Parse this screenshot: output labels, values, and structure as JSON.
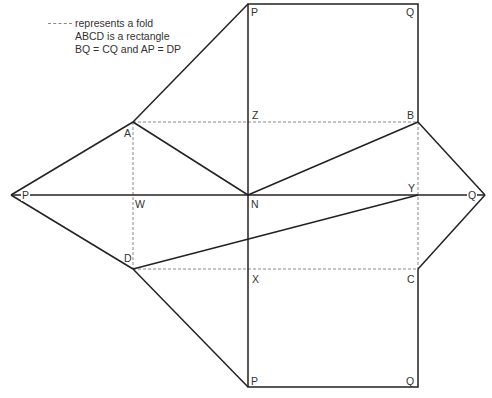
{
  "legend": {
    "fold_text": "represents a fold",
    "line2": "ABCD is a rectangle",
    "line3": "BQ = CQ and AP = DP"
  },
  "points": {
    "P_top": {
      "label": "P",
      "x": 248,
      "y": 4
    },
    "Q_top": {
      "label": "Q",
      "x": 418,
      "y": 4
    },
    "Z": {
      "label": "Z",
      "x": 248,
      "y": 122
    },
    "B": {
      "label": "B",
      "x": 418,
      "y": 122
    },
    "A": {
      "label": "A",
      "x": 133,
      "y": 122
    },
    "P_left": {
      "label": "P",
      "x": 11,
      "y": 195
    },
    "W": {
      "label": "W",
      "x": 133,
      "y": 195
    },
    "N": {
      "label": "N",
      "x": 248,
      "y": 195
    },
    "Y": {
      "label": "Y",
      "x": 418,
      "y": 195
    },
    "Q_right": {
      "label": "Q",
      "x": 485,
      "y": 195
    },
    "D": {
      "label": "D",
      "x": 133,
      "y": 269
    },
    "X": {
      "label": "X",
      "x": 248,
      "y": 269
    },
    "C": {
      "label": "C",
      "x": 418,
      "y": 269
    },
    "P_bottom": {
      "label": "P",
      "x": 248,
      "y": 387
    },
    "Q_bottom": {
      "label": "Q",
      "x": 418,
      "y": 387
    }
  },
  "colors": {
    "line": "#222222",
    "fold": "#888888",
    "text": "#333333"
  }
}
